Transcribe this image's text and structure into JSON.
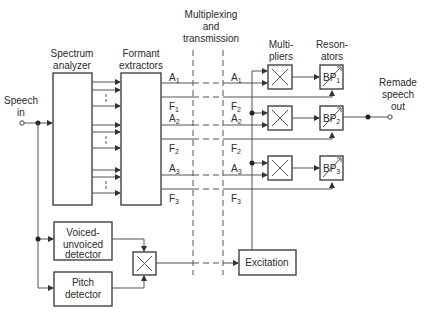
{
  "title_labels": {
    "multiplexing": [
      "Multiplexing",
      "and",
      "transmission"
    ],
    "spectrum_analyzer": [
      "Spectrum",
      "analyzer"
    ],
    "formant_extractors": [
      "Formant",
      "extractors"
    ],
    "multipliers": [
      "Multi-",
      "pliers"
    ],
    "resonators": [
      "Reson-",
      "ators"
    ],
    "speech_in": [
      "Speech",
      "in"
    ],
    "remade_speech_out": [
      "Remade",
      "speech",
      "out"
    ]
  },
  "blocks": {
    "voiced_unvoiced": [
      "Voiced-",
      "unvoiced",
      "detector"
    ],
    "pitch": [
      "Pitch",
      "detector"
    ],
    "excitation": "Excitation"
  },
  "left_signals": [
    {
      "base": "A",
      "sub": "1"
    },
    {
      "base": "F",
      "sub": "1"
    },
    {
      "base": "A",
      "sub": "2"
    },
    {
      "base": "F",
      "sub": "2"
    },
    {
      "base": "A",
      "sub": "3"
    },
    {
      "base": "F",
      "sub": "3"
    }
  ],
  "right_signals": [
    {
      "base": "A",
      "sub": "1"
    },
    {
      "base": "F",
      "sub": "2"
    },
    {
      "base": "A",
      "sub": "2"
    },
    {
      "base": "F",
      "sub": "2"
    },
    {
      "base": "A",
      "sub": "3"
    },
    {
      "base": "F",
      "sub": "3"
    }
  ],
  "resonators": [
    {
      "base": "BP",
      "sub": "1"
    },
    {
      "base": "BP",
      "sub": "2"
    },
    {
      "base": "BP",
      "sub": "3"
    }
  ],
  "multiplier_symbol": "×"
}
